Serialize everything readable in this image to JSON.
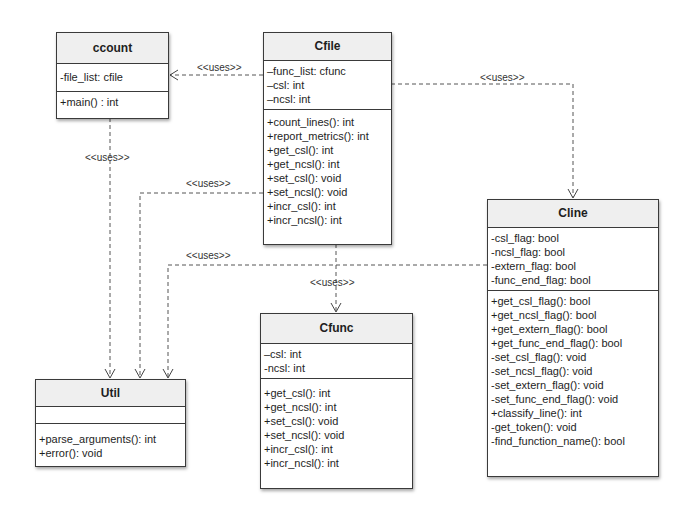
{
  "classes": {
    "ccount": {
      "name": "ccount",
      "attributes": [
        "-file_list: cfile"
      ],
      "methods": [
        "+main() : int"
      ]
    },
    "cfile": {
      "name": "Cfile",
      "attributes": [
        "–func_list: cfunc",
        "–csl: int",
        "–ncsl: int"
      ],
      "methods": [
        "+count_lines(): int",
        "+report_metrics(): int",
        "+get_csl(): int",
        "+get_ncsl(): int",
        "+set_csl(): void",
        "+set_ncsl(): void",
        "+incr_csl(): int",
        "+incr_ncsl(): int"
      ]
    },
    "cline": {
      "name": "Cline",
      "attributes": [
        "-csl_flag: bool",
        "-ncsl_flag: bool",
        "-extern_flag: bool",
        "-func_end_flag: bool"
      ],
      "methods": [
        "+get_csl_flag(): bool",
        "+get_ncsl_flag(): bool",
        "+get_extern_flag(): bool",
        "+get_func_end_flag(): bool",
        "-set_csl_flag(): void",
        "-set_ncsl_flag(): void",
        "-set_extern_flag(): void",
        "-set_func_end_flag(): void",
        "+classify_line(): int",
        "-get_token(): void",
        "-find_function_name(): bool"
      ]
    },
    "cfunc": {
      "name": "Cfunc",
      "attributes": [
        "–csl: int",
        "-ncsl: int"
      ],
      "methods": [
        "+get_csl(): int",
        "+get_ncsl(): int",
        "+set_csl(): void",
        "+set_ncsl(): void",
        "+incr_csl(): int",
        "+incr_ncsl(): int"
      ]
    },
    "util": {
      "name": "Util",
      "attributes": [],
      "methods": [
        "+parse_arguments(): int",
        "+error(): void"
      ]
    }
  },
  "relations": [
    {
      "from": "Cfile",
      "to": "ccount",
      "label": "<<uses>>"
    },
    {
      "from": "Cfile",
      "to": "Cline",
      "label": "<<uses>>"
    },
    {
      "from": "ccount",
      "to": "Util",
      "label": "<<uses>>"
    },
    {
      "from": "Cfile",
      "to": "Util",
      "label": "<<uses>>"
    },
    {
      "from": "Cline",
      "to": "Util",
      "label": "<<uses>>"
    },
    {
      "from": "Cfile",
      "to": "Cfunc",
      "label": "<<uses>>"
    }
  ]
}
